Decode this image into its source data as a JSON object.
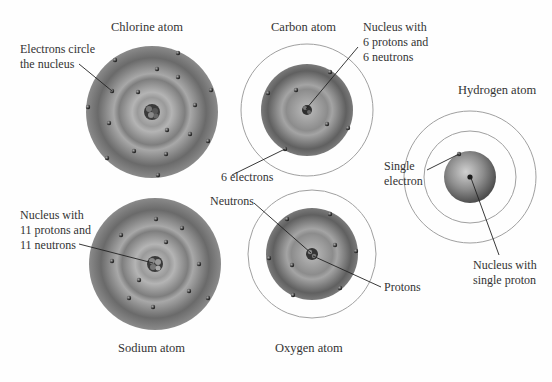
{
  "atoms": {
    "chlorine": {
      "title": "Chlorine atom",
      "callout": [
        "Electrons circle",
        "the nucleus"
      ]
    },
    "carbon": {
      "title": "Carbon atom",
      "nucleus_callout": [
        "Nucleus with",
        "6 protons and",
        "6 neutrons"
      ],
      "electrons_callout": "6 electrons"
    },
    "hydrogen": {
      "title": "Hydrogen atom",
      "electron_callout": [
        "Single",
        "electron"
      ],
      "nucleus_callout": [
        "Nucleus with",
        "single proton"
      ]
    },
    "sodium": {
      "title": "Sodium atom",
      "callout": [
        "Nucleus with",
        "11 protons and",
        "11 neutrons"
      ]
    },
    "oxygen": {
      "title": "Oxygen atom",
      "neutrons_callout": "Neutrons",
      "protons_callout": "Protons"
    }
  },
  "colors": {
    "background": "#fefefe",
    "sphere_dark": "#5e5e5e",
    "sphere_light": "#bdbdbd",
    "orbit_ring": "#9a9a9a",
    "electron": "#222222",
    "leader_line": "#222222"
  }
}
